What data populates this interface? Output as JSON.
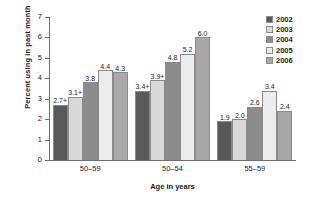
{
  "chart_data": {
    "type": "bar",
    "title": "",
    "xlabel": "Age in years",
    "ylabel": "Percent using in past month",
    "ylim": [
      0,
      7
    ],
    "ytick_labels": [
      "0",
      "1",
      "2",
      "3",
      "4",
      "5",
      "6",
      "7"
    ],
    "grid": false,
    "legend_position": "top-right",
    "categories": [
      "50–59",
      "50–54",
      "55–59"
    ],
    "series": [
      {
        "name": "2002",
        "color": "#595959",
        "values": [
          2.7,
          3.4,
          1.9
        ],
        "labels": [
          "2.7+",
          "3.4+",
          "1.9"
        ]
      },
      {
        "name": "2003",
        "color": "#d9d9d9",
        "values": [
          3.1,
          3.9,
          2.0
        ],
        "labels": [
          "3.1+",
          "3.9+",
          "2.0"
        ]
      },
      {
        "name": "2004",
        "color": "#8c8c8c",
        "values": [
          3.8,
          4.8,
          2.6
        ],
        "labels": [
          "3.8",
          "4.8",
          "2.6"
        ]
      },
      {
        "name": "2005",
        "color": "#ececec",
        "values": [
          4.4,
          5.2,
          3.4
        ],
        "labels": [
          "4.4",
          "5.2",
          "3.4"
        ]
      },
      {
        "name": "2006",
        "color": "#a8a8a8",
        "values": [
          4.3,
          6.0,
          2.4
        ],
        "labels": [
          "4.3",
          "6.0",
          "2.4"
        ]
      }
    ]
  }
}
